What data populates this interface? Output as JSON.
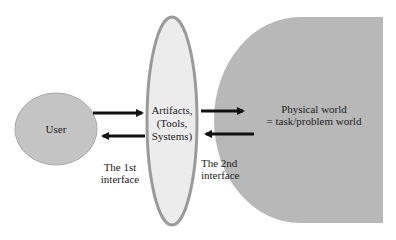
{
  "nodes": {
    "user": {
      "label": "User",
      "fill": "#c4c4c4",
      "stroke": "#a8a8a8"
    },
    "artifacts": {
      "label_lines": [
        "Artifacts,",
        "(Tools,",
        "Systems)"
      ],
      "fill": "#ececec",
      "stroke": "#9a9a9a"
    },
    "physical_world": {
      "label_lines": [
        "Physical world",
        "= task/problem world"
      ],
      "fill": "#b8b8b8"
    }
  },
  "interfaces": {
    "first": {
      "label_lines": [
        "The 1st",
        "interface"
      ]
    },
    "second": {
      "label_lines": [
        "The 2nd",
        "interface"
      ]
    }
  },
  "arrows": [
    {
      "from": "user",
      "to": "artifacts"
    },
    {
      "from": "artifacts",
      "to": "user"
    },
    {
      "from": "artifacts",
      "to": "physical_world"
    },
    {
      "from": "physical_world",
      "to": "artifacts"
    }
  ],
  "colors": {
    "arrow": "#111111"
  }
}
